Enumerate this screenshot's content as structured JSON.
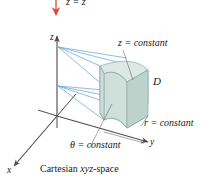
{
  "figure": {
    "caption_prefix": "Cartesian ",
    "caption_italic": "xyz",
    "caption_suffix": "-space",
    "caption_full": "Cartesian xyz-space",
    "top_equation": "z = z",
    "region_label": "D",
    "axes": {
      "x": "x",
      "y": "y",
      "z": "z"
    },
    "annotations": {
      "z_constant": "z  =  constant",
      "r_constant": "r  =  constant",
      "theta_constant": "θ  =  constant"
    },
    "colors": {
      "solid_fill": "#c6d8d1",
      "solid_fill_light": "#d8e6e0",
      "solid_fill_dark": "#b3c9c1",
      "solid_edge": "#8fa9a2",
      "projection_line": "#6aa7d8",
      "axis": "#4a4a4a",
      "arrow_red": "#e04a3a",
      "text": "#1a1a1a",
      "background": "#ffffff"
    }
  }
}
